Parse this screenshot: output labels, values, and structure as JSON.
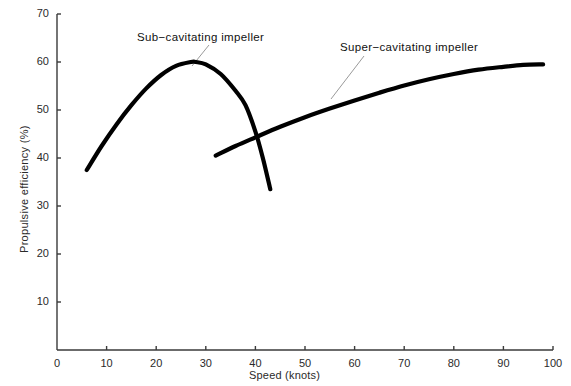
{
  "chart_data": {
    "type": "line",
    "title": "",
    "xlabel": "Speed (knots)",
    "ylabel": "Propulsive efficiency (%)",
    "xlim": [
      0,
      100
    ],
    "ylim": [
      0,
      70
    ],
    "xticks": [
      0,
      10,
      20,
      30,
      40,
      50,
      60,
      70,
      80,
      90,
      100
    ],
    "yticks": [
      10,
      20,
      30,
      40,
      50,
      60,
      70
    ],
    "grid": false,
    "legend": "annotations-on-plot",
    "line_color": "#000000",
    "axis_color": "#3a3a3a",
    "leader_color": "#9a9a9a",
    "series": [
      {
        "name": "Sub-cavitating impeller",
        "label": "Sub−cavitating impeller",
        "x": [
          6,
          9,
          12,
          15,
          18,
          21,
          24,
          27,
          28,
          30,
          33,
          36,
          38,
          40,
          41.5,
          43
        ],
        "y": [
          37.5,
          42.5,
          47,
          51,
          54.5,
          57.3,
          59.2,
          60,
          60,
          59.5,
          57.5,
          54,
          51,
          45.5,
          40,
          33.5
        ]
      },
      {
        "name": "Super-cavitating impeller",
        "label": "Super−cavitating impeller",
        "x": [
          32,
          36,
          40,
          45,
          50,
          55,
          60,
          65,
          70,
          75,
          80,
          85,
          90,
          94,
          98
        ],
        "y": [
          40.5,
          42.5,
          44.3,
          46.5,
          48.5,
          50.3,
          52.0,
          53.6,
          55.1,
          56.4,
          57.5,
          58.4,
          59.0,
          59.4,
          59.5
        ]
      }
    ],
    "annotations": [
      {
        "name": "sub-cavitating-annotation",
        "text": "Sub−cavitating impeller",
        "text_x": 137,
        "text_y": 31,
        "leader_from_x": 209,
        "leader_from_y": 45,
        "leader_to_x": 192,
        "leader_to_y": 66
      },
      {
        "name": "super-cavitating-annotation",
        "text": "Super−cavitating impeller",
        "text_x": 340,
        "text_y": 41,
        "leader_from_x": 364,
        "leader_from_y": 56,
        "leader_to_x": 331,
        "leader_to_y": 99
      }
    ]
  },
  "axes": {
    "origin_label": "0",
    "x_title": "Speed (knots)",
    "y_title": "Propulsive efficiency (%)"
  },
  "crop_artifact": {
    "text": "· ·  ··· ·  ·· ··· ·  ··"
  }
}
